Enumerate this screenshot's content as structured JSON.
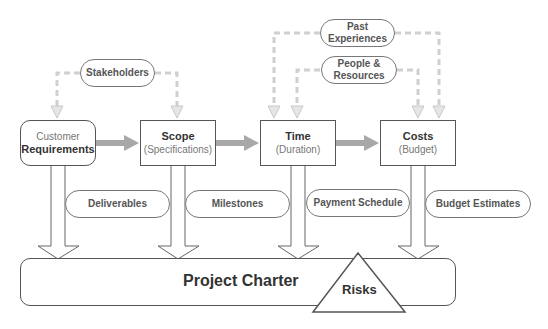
{
  "diagram": {
    "main_nodes": [
      {
        "id": "customer",
        "line1": "Customer",
        "line2": "Requirements",
        "shape": "rounded-rectangle"
      },
      {
        "id": "scope",
        "line1": "Scope",
        "line2": "(Specifications)",
        "shape": "rectangle"
      },
      {
        "id": "time",
        "line1": "Time",
        "line2": "(Duration)",
        "shape": "rectangle"
      },
      {
        "id": "costs",
        "line1": "Costs",
        "line2": "(Budget)",
        "shape": "rectangle"
      }
    ],
    "input_pills": [
      {
        "id": "stakeholders",
        "label": "Stakeholders",
        "targets": [
          "customer",
          "scope"
        ]
      },
      {
        "id": "past_experiences",
        "line1": "Past",
        "line2": "Experiences",
        "targets": [
          "time",
          "costs"
        ]
      },
      {
        "id": "people_resources",
        "line1": "People &",
        "line2": "Resources",
        "targets": [
          "time",
          "costs"
        ]
      }
    ],
    "output_pills": [
      {
        "id": "deliverables",
        "label": "Deliverables"
      },
      {
        "id": "milestones",
        "label": "Milestones"
      },
      {
        "id": "payment_schedule",
        "label": "Payment Schedule"
      },
      {
        "id": "budget_estimates",
        "label": "Budget Estimates"
      }
    ],
    "charter": {
      "label": "Project Charter"
    },
    "risks": {
      "label": "Risks"
    },
    "flow": [
      "customer",
      "scope",
      "time",
      "costs"
    ],
    "colors": {
      "stroke": "#555555",
      "dashed_arrow": "#cccccc",
      "flow_arrow": "#999999",
      "text_dark": "#333333",
      "text_light": "#777777"
    }
  }
}
